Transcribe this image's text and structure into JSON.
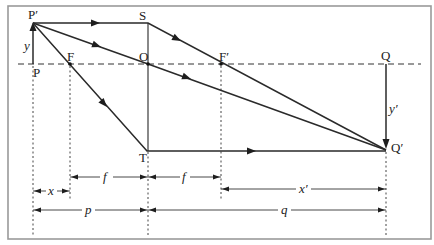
{
  "diagram": {
    "points": {
      "object_tip": "P′",
      "object_base": "P",
      "focal_front": "F",
      "optical_center": "O",
      "lens_top": "S",
      "lens_bottom": "T",
      "focal_back": "F′",
      "image_base": "Q",
      "image_tip": "Q′"
    },
    "heights": {
      "object": "y",
      "image": "y′"
    },
    "dimensions": {
      "x": "x",
      "f_front": "f",
      "f_back": "f",
      "x_prime": "x′",
      "p": "p",
      "q": "q"
    },
    "colors": {
      "line": "#2a2a2a",
      "frame": "#9a9a9a",
      "background": "#ffffff"
    }
  }
}
